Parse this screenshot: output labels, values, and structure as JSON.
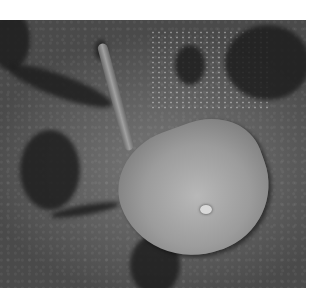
{
  "image": {
    "description": "Grayscale underwater photograph of a ray resting on a sandy seafloor among clumps of dark seaweed",
    "subject": "ray",
    "palette": {
      "sand": "#5e5e5e",
      "ray_body": "#a8a8a8",
      "seaweed": "#1e1e1e",
      "border": "#ffffff"
    }
  }
}
